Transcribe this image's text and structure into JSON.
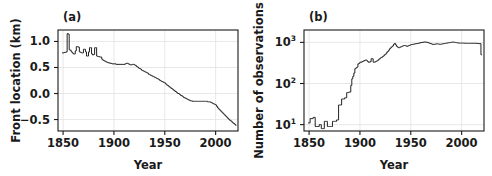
{
  "figure": {
    "background": "#ffffff",
    "line_color": "#222222",
    "axis_color": "#1a1a1a",
    "grid_color": "#e2e2e2"
  },
  "panels": [
    {
      "label": "(a)",
      "xlabel": "Year",
      "ylabel": "Front location (km)",
      "xticks": [
        "1850",
        "1900",
        "1950",
        "2000"
      ],
      "yticks": [
        "1.0",
        "0.5",
        "0.0",
        "−0.5"
      ]
    },
    {
      "label": "(b)",
      "xlabel": "Year",
      "ylabel": "Number of observations",
      "xticks": [
        "1850",
        "1900",
        "1950",
        "2000"
      ],
      "yticks": [
        "10",
        "10",
        "10"
      ],
      "ytick_exponents": [
        "3",
        "2",
        "1"
      ]
    }
  ],
  "chart_data": [
    {
      "type": "line",
      "title": "(a)",
      "xlabel": "Year",
      "ylabel": "Front location (km)",
      "xlim": [
        1845,
        2022
      ],
      "ylim": [
        -0.72,
        1.22
      ],
      "xticks": [
        1850,
        1900,
        1950,
        2000
      ],
      "yticks": [
        1.0,
        0.5,
        0.0,
        -0.5
      ],
      "grid": true,
      "legend": "none",
      "yscale": "linear",
      "x": [
        1849,
        1850,
        1851,
        1852,
        1853,
        1854,
        1855,
        1856,
        1857,
        1858,
        1859,
        1860,
        1861,
        1862,
        1863,
        1864,
        1865,
        1866,
        1867,
        1868,
        1869,
        1870,
        1871,
        1872,
        1873,
        1874,
        1875,
        1876,
        1877,
        1878,
        1879,
        1880,
        1881,
        1882,
        1883,
        1884,
        1885,
        1886,
        1887,
        1888,
        1889,
        1890,
        1891,
        1892,
        1893,
        1894,
        1895,
        1896,
        1897,
        1898,
        1899,
        1900,
        1901,
        1902,
        1903,
        1904,
        1905,
        1906,
        1907,
        1908,
        1909,
        1910,
        1911,
        1912,
        1913,
        1914,
        1915,
        1916,
        1917,
        1918,
        1919,
        1920,
        1921,
        1922,
        1923,
        1924,
        1925,
        1926,
        1927,
        1928,
        1929,
        1930,
        1931,
        1932,
        1933,
        1934,
        1935,
        1936,
        1937,
        1938,
        1939,
        1940,
        1941,
        1942,
        1943,
        1944,
        1945,
        1946,
        1947,
        1948,
        1949,
        1950,
        1951,
        1952,
        1953,
        1954,
        1955,
        1956,
        1957,
        1958,
        1959,
        1960,
        1961,
        1962,
        1963,
        1964,
        1965,
        1966,
        1967,
        1968,
        1969,
        1970,
        1971,
        1972,
        1973,
        1974,
        1975,
        1976,
        1977,
        1978,
        1979,
        1980,
        1981,
        1982,
        1983,
        1984,
        1985,
        1986,
        1987,
        1988,
        1989,
        1990,
        1991,
        1992,
        1993,
        1994,
        1995,
        1996,
        1997,
        1998,
        1999,
        2000,
        2001,
        2002,
        2003,
        2004,
        2005,
        2006,
        2007,
        2008,
        2009,
        2010,
        2011,
        2012,
        2013,
        2014,
        2015,
        2016,
        2017,
        2018,
        2019,
        2020
      ],
      "y": [
        0.78,
        0.78,
        0.79,
        0.79,
        0.8,
        1.15,
        1.14,
        0.84,
        0.83,
        0.8,
        0.78,
        0.76,
        0.76,
        0.82,
        0.9,
        0.9,
        0.89,
        0.8,
        0.79,
        0.78,
        0.78,
        0.85,
        0.85,
        0.8,
        0.72,
        0.72,
        0.8,
        0.88,
        0.88,
        0.76,
        0.74,
        0.75,
        0.88,
        0.88,
        0.72,
        0.71,
        0.71,
        0.7,
        0.7,
        0.66,
        0.64,
        0.63,
        0.62,
        0.61,
        0.6,
        0.59,
        0.59,
        0.58,
        0.58,
        0.57,
        0.57,
        0.57,
        0.57,
        0.56,
        0.56,
        0.56,
        0.56,
        0.56,
        0.56,
        0.56,
        0.56,
        0.56,
        0.57,
        0.58,
        0.58,
        0.57,
        0.56,
        0.55,
        0.55,
        0.56,
        0.56,
        0.55,
        0.54,
        0.52,
        0.51,
        0.49,
        0.48,
        0.47,
        0.45,
        0.44,
        0.43,
        0.42,
        0.41,
        0.4,
        0.39,
        0.37,
        0.36,
        0.35,
        0.34,
        0.33,
        0.32,
        0.31,
        0.3,
        0.29,
        0.28,
        0.27,
        0.25,
        0.24,
        0.23,
        0.22,
        0.21,
        0.2,
        0.18,
        0.16,
        0.15,
        0.13,
        0.12,
        0.1,
        0.09,
        0.07,
        0.06,
        0.04,
        0.03,
        0.01,
        0.0,
        -0.01,
        -0.03,
        -0.04,
        -0.05,
        -0.07,
        -0.08,
        -0.09,
        -0.1,
        -0.11,
        -0.12,
        -0.13,
        -0.14,
        -0.14,
        -0.15,
        -0.15,
        -0.15,
        -0.15,
        -0.15,
        -0.15,
        -0.15,
        -0.15,
        -0.15,
        -0.15,
        -0.15,
        -0.15,
        -0.15,
        -0.15,
        -0.15,
        -0.16,
        -0.16,
        -0.16,
        -0.17,
        -0.18,
        -0.19,
        -0.2,
        -0.21,
        -0.22,
        -0.25,
        -0.28,
        -0.3,
        -0.32,
        -0.34,
        -0.36,
        -0.38,
        -0.4,
        -0.42,
        -0.44,
        -0.46,
        -0.48,
        -0.5,
        -0.52,
        -0.53,
        -0.55,
        -0.57,
        -0.58,
        -0.6,
        -0.62
      ]
    },
    {
      "type": "line",
      "title": "(b)",
      "xlabel": "Year",
      "ylabel": "Number of observations",
      "xlim": [
        1845,
        2022
      ],
      "ylim": [
        7,
        2000
      ],
      "xticks": [
        1850,
        1900,
        1950,
        2000
      ],
      "yticks": [
        10,
        100,
        1000
      ],
      "ytick_labels": [
        "10^1",
        "10^2",
        "10^3"
      ],
      "grid": true,
      "legend": "none",
      "yscale": "log",
      "x": [
        1849,
        1850,
        1851,
        1852,
        1853,
        1854,
        1855,
        1856,
        1857,
        1858,
        1859,
        1860,
        1861,
        1862,
        1863,
        1864,
        1865,
        1866,
        1867,
        1868,
        1869,
        1870,
        1871,
        1872,
        1873,
        1874,
        1875,
        1876,
        1877,
        1878,
        1879,
        1880,
        1881,
        1882,
        1883,
        1884,
        1885,
        1886,
        1887,
        1888,
        1889,
        1890,
        1891,
        1892,
        1893,
        1894,
        1895,
        1896,
        1897,
        1898,
        1899,
        1900,
        1901,
        1902,
        1903,
        1904,
        1905,
        1906,
        1907,
        1908,
        1909,
        1910,
        1911,
        1912,
        1913,
        1914,
        1915,
        1916,
        1917,
        1918,
        1919,
        1920,
        1921,
        1922,
        1923,
        1924,
        1925,
        1926,
        1927,
        1928,
        1929,
        1930,
        1931,
        1932,
        1933,
        1934,
        1935,
        1936,
        1937,
        1938,
        1939,
        1940,
        1941,
        1942,
        1943,
        1944,
        1945,
        1946,
        1947,
        1948,
        1949,
        1950,
        1951,
        1952,
        1953,
        1954,
        1955,
        1956,
        1957,
        1958,
        1959,
        1960,
        1961,
        1962,
        1963,
        1964,
        1965,
        1966,
        1967,
        1968,
        1969,
        1970,
        1971,
        1972,
        1973,
        1974,
        1975,
        1976,
        1977,
        1978,
        1979,
        1980,
        1981,
        1982,
        1983,
        1984,
        1985,
        1986,
        1987,
        1988,
        1989,
        1990,
        1991,
        1992,
        1993,
        1994,
        1995,
        1996,
        1997,
        1998,
        1999,
        2000,
        2001,
        2002,
        2003,
        2004,
        2005,
        2006,
        2007,
        2008,
        2009,
        2010,
        2011,
        2012,
        2013,
        2014,
        2015,
        2016,
        2017,
        2018,
        2019,
        2020
      ],
      "y": [
        11,
        11,
        14,
        14,
        14,
        15,
        15,
        9,
        9,
        9,
        9,
        10,
        10,
        8,
        8,
        8,
        12,
        12,
        12,
        9,
        9,
        9,
        9,
        9,
        12,
        12,
        12,
        12,
        13,
        13,
        30,
        30,
        30,
        42,
        42,
        42,
        45,
        45,
        60,
        60,
        62,
        62,
        90,
        130,
        150,
        180,
        230,
        240,
        250,
        300,
        310,
        330,
        330,
        340,
        350,
        360,
        370,
        370,
        350,
        330,
        330,
        340,
        400,
        400,
        330,
        330,
        340,
        350,
        360,
        380,
        400,
        420,
        430,
        450,
        470,
        500,
        520,
        560,
        600,
        640,
        700,
        740,
        780,
        820,
        900,
        940,
        870,
        800,
        760,
        740,
        760,
        780,
        800,
        820,
        840,
        840,
        820,
        800,
        820,
        840,
        860,
        880,
        890,
        900,
        910,
        920,
        930,
        940,
        950,
        960,
        980,
        990,
        1000,
        1010,
        1020,
        1020,
        1010,
        1000,
        980,
        960,
        940,
        920,
        900,
        890,
        900,
        910,
        920,
        920,
        910,
        900,
        900,
        910,
        920,
        930,
        940,
        950,
        960,
        970,
        980,
        990,
        1000,
        1010,
        1020,
        1010,
        1000,
        990,
        980,
        970,
        960,
        960,
        960,
        960,
        960,
        960,
        950,
        950,
        950,
        950,
        950,
        950,
        950,
        950,
        950,
        950,
        950,
        950,
        940,
        940,
        930,
        930,
        500,
        500
      ]
    }
  ]
}
